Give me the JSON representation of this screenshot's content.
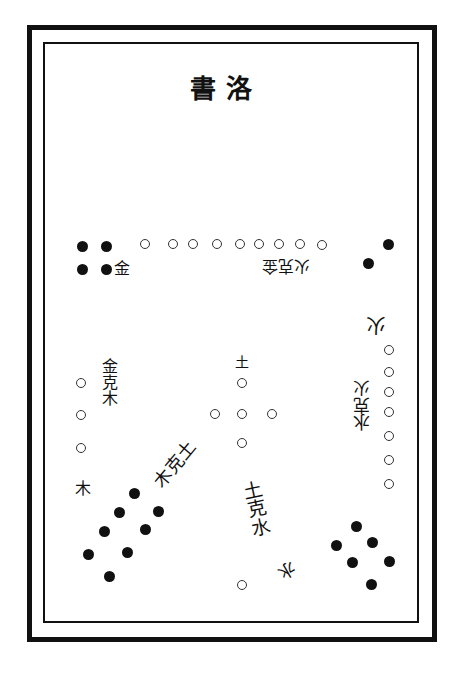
{
  "title": "書洛",
  "colors": {
    "ink": "#111111",
    "paper": "#ffffff"
  },
  "labels": {
    "metal": "金",
    "fire_overcomes_metal": "火克金",
    "fire": "火",
    "water_overcomes_fire": "水克火",
    "metal_overcomes_wood": "金克木",
    "wood": "木",
    "earth": "土",
    "wood_overcomes_earth": "木克土",
    "earth_overcomes_water": "土克水",
    "water": "水"
  },
  "groups": [
    {
      "name": "top-left",
      "type": "yin",
      "count": 4
    },
    {
      "name": "top-row",
      "type": "yang",
      "count": 9
    },
    {
      "name": "top-right",
      "type": "yin",
      "count": 2
    },
    {
      "name": "right-column",
      "type": "yang",
      "count": 7
    },
    {
      "name": "center",
      "type": "yang",
      "count": 5
    },
    {
      "name": "left-column",
      "type": "yang",
      "count": 3
    },
    {
      "name": "bottom-left-diagonal",
      "type": "yin",
      "count": 8
    },
    {
      "name": "bottom-right",
      "type": "yin",
      "count": 6
    },
    {
      "name": "bottom",
      "type": "yang",
      "count": 1
    }
  ]
}
